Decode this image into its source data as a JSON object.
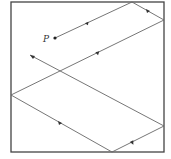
{
  "diagram": {
    "type": "billiard-path-in-square",
    "point_label": "P",
    "colors": {
      "frame": "#444444",
      "path": "#666666",
      "arrow": "#333333"
    },
    "square": {
      "x": 11,
      "y": 2,
      "w": 153,
      "h": 150
    },
    "path_points": [
      [
        55,
        38
      ],
      [
        132,
        2
      ],
      [
        164,
        20
      ],
      [
        11,
        95
      ],
      [
        112,
        152
      ],
      [
        164,
        126
      ],
      [
        30,
        55
      ]
    ]
  }
}
